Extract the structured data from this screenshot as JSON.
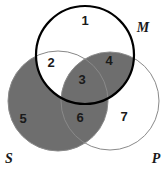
{
  "figure": {
    "type": "venn-diagram",
    "background_color": "#ffffff",
    "canvas": {
      "width": 166,
      "height": 177
    }
  },
  "colors": {
    "shaded_fill": "#6e6e6e",
    "unshaded_fill": "#ffffff",
    "thick_stroke": "#000000",
    "thin_stroke": "#8a8a8a",
    "text": "#1a1a1a"
  },
  "circles": [
    {
      "id": "M",
      "label": "M",
      "cx": 85,
      "cy": 55,
      "r": 49,
      "stroke": "#000000",
      "stroke_width": 2.2,
      "label_x": 143,
      "label_y": 29
    },
    {
      "id": "S",
      "label": "S",
      "cx": 58,
      "cy": 101,
      "r": 50,
      "stroke": "#8a8a8a",
      "stroke_width": 1,
      "label_x": 9,
      "label_y": 160
    },
    {
      "id": "P",
      "label": "P",
      "cx": 110,
      "cy": 101,
      "r": 49,
      "stroke": "#8a8a8a",
      "stroke_width": 1,
      "label_x": 156,
      "label_y": 160
    }
  ],
  "regions": [
    {
      "id": "r1",
      "number": "1",
      "x": 85,
      "y": 22,
      "shaded": false,
      "sets": "M only"
    },
    {
      "id": "r2",
      "number": "2",
      "x": 51,
      "y": 64,
      "shaded": false,
      "sets": "M and S"
    },
    {
      "id": "r3",
      "number": "3",
      "x": 82,
      "y": 81,
      "shaded": true,
      "sets": "M and S and P"
    },
    {
      "id": "r4",
      "number": "4",
      "x": 109,
      "y": 62,
      "shaded": true,
      "sets": "M and P"
    },
    {
      "id": "r5",
      "number": "5",
      "x": 23,
      "y": 120,
      "shaded": true,
      "sets": "S only"
    },
    {
      "id": "r6",
      "number": "6",
      "x": 80,
      "y": 119,
      "shaded": true,
      "sets": "S and P"
    },
    {
      "id": "r7",
      "number": "7",
      "x": 124,
      "y": 118,
      "shaded": false,
      "sets": "P only"
    }
  ]
}
